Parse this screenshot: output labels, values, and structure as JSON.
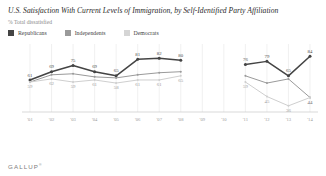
{
  "header": {
    "title": "U.S. Satisfaction With Current Levels of Immigration, by Self-Identified Party Affiliation",
    "subtitle": "% Total dissatisfied"
  },
  "footer": {
    "brand": "GALLUP",
    "trademark": "®"
  },
  "legend": {
    "items": [
      {
        "label": "Republicans",
        "color": "#444444"
      },
      {
        "label": "Independents",
        "color": "#9a9a9a"
      },
      {
        "label": "Democrats",
        "color": "#cfcfcf"
      }
    ]
  },
  "chart_data": {
    "type": "line",
    "title": "U.S. Satisfaction With Current Levels of Immigration, by Self-Identified Party Affiliation",
    "subtitle": "% Total dissatisfied",
    "xlabel": "",
    "ylabel": "% Total dissatisfied",
    "ylim": [
      30,
      90
    ],
    "grid": "vertical",
    "legend_position": "top-left",
    "categories": [
      "'01",
      "'02",
      "'03",
      "'04",
      "'05",
      "'06",
      "'07",
      "'08",
      "'09",
      "'10",
      "'11",
      "'12",
      "'13",
      "'14"
    ],
    "series": [
      {
        "name": "Republicans",
        "color": "#444444",
        "values": [
          61,
          69,
          75,
          69,
          65,
          81,
          82,
          80,
          null,
          null,
          76,
          79,
          65,
          84
        ],
        "labels": [
          "61",
          "69",
          "75",
          "69",
          "65",
          "81",
          "82",
          "80",
          "",
          "",
          "76",
          "79",
          "65",
          "84"
        ]
      },
      {
        "name": "Independents",
        "color": "#9a9a9a",
        "values": [
          59,
          66,
          67,
          64,
          63,
          66,
          68,
          69,
          null,
          null,
          65,
          58,
          62,
          44
        ],
        "labels": [
          "",
          "",
          "",
          "",
          "",
          "",
          "",
          "",
          "",
          "",
          "",
          "",
          "",
          "44"
        ]
      },
      {
        "name": "Democrats",
        "color": "#cfcfcf",
        "values": [
          59,
          62,
          59,
          61,
          58,
          61,
          61,
          65,
          null,
          null,
          59,
          45,
          36,
          44
        ],
        "labels": [
          "59",
          "62",
          "59",
          "61",
          "58",
          "61",
          "61",
          "65",
          "",
          "",
          "59",
          "45",
          "36",
          "44"
        ]
      }
    ]
  }
}
